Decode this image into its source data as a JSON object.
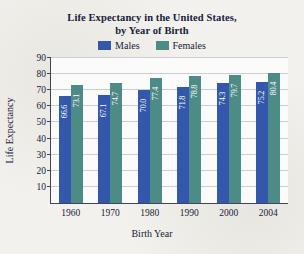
{
  "chart_data": {
    "type": "bar",
    "title": "Life Expectancy in the United States, by Year of Birth",
    "title_line1": "Life Expectancy in the United States,",
    "title_line2": "by Year of Birth",
    "xlabel": "Birth Year",
    "ylabel": "Life Expectancy",
    "categories": [
      "1960",
      "1970",
      "1980",
      "1990",
      "2000",
      "2004"
    ],
    "series": [
      {
        "name": "Males",
        "color": "#3257ab",
        "values": [
          66.6,
          67.1,
          70.0,
          71.8,
          74.3,
          75.2
        ]
      },
      {
        "name": "Females",
        "color": "#4d8b87",
        "values": [
          73.1,
          74.7,
          77.4,
          78.8,
          79.7,
          80.4
        ]
      }
    ],
    "ylim": [
      0,
      90
    ],
    "yticks": [
      10,
      20,
      30,
      40,
      50,
      60,
      70,
      80,
      90
    ],
    "grid": true,
    "legend_position": "top",
    "value_labels": true
  }
}
